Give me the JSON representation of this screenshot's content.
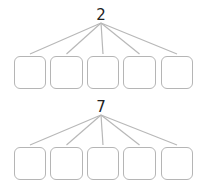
{
  "diagrams": [
    {
      "root_value": "2",
      "root_x": 101,
      "root_label_y": 7,
      "line_start_y": 23,
      "line_end_y": 54,
      "box_top": 56,
      "box_height": 33,
      "boxes": [
        {
          "x": 14,
          "w": 32,
          "value": ""
        },
        {
          "x": 50,
          "w": 33,
          "value": ""
        },
        {
          "x": 87,
          "w": 32,
          "value": ""
        },
        {
          "x": 123,
          "w": 33,
          "value": ""
        },
        {
          "x": 161,
          "w": 32,
          "value": ""
        }
      ]
    },
    {
      "root_value": "7",
      "root_x": 101,
      "root_label_y": 99,
      "line_start_y": 115,
      "line_end_y": 145,
      "box_top": 147,
      "box_height": 33,
      "boxes": [
        {
          "x": 14,
          "w": 32,
          "value": ""
        },
        {
          "x": 50,
          "w": 33,
          "value": ""
        },
        {
          "x": 87,
          "w": 32,
          "value": ""
        },
        {
          "x": 123,
          "w": 33,
          "value": ""
        },
        {
          "x": 161,
          "w": 32,
          "value": ""
        }
      ]
    }
  ],
  "colors": {
    "line": "#b8b8b8",
    "box_border": "#b5b5b5",
    "text": "#222222"
  }
}
